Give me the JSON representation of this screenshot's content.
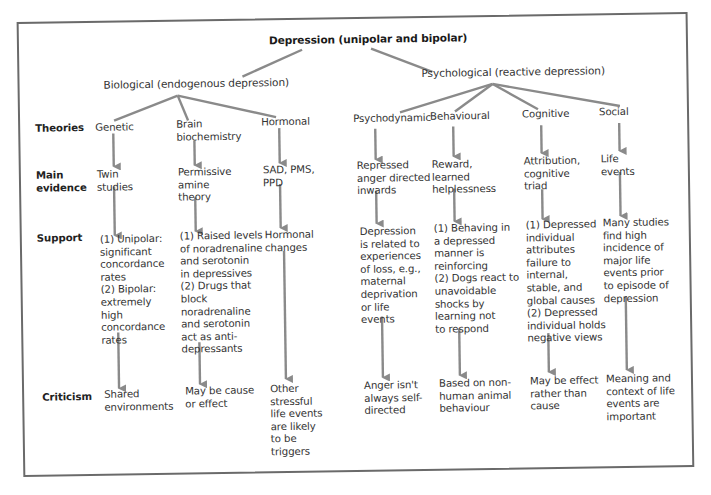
{
  "diagram": {
    "title": "Depression (unipolar and bipolar)",
    "branches": [
      {
        "label": "Biological (endogenous depression)"
      },
      {
        "label": "Psychological (reactive depression)"
      }
    ],
    "row_labels": {
      "theories": "Theories",
      "main_evidence": "Main\nevidence",
      "support": "Support",
      "criticism": "Criticism"
    },
    "columns": [
      {
        "branch": "Biological",
        "theory": "Genetic",
        "evidence": "Twin\nstudies",
        "support": "(1) Unipolar:\nsignificant\nconcordance\nrates\n(2) Bipolar:\nextremely\nhigh\nconcordance\nrates",
        "criticism": "Shared\nenvironments"
      },
      {
        "branch": "Biological",
        "theory": "Brain\nbiochemistry",
        "evidence": "Permissive\namine\ntheory",
        "support": "(1) Raised levels\nof noradrenaline\nand serotonin\nin depressives\n(2) Drugs that\nblock\nnoradrenaline\nand serotonin\nact as anti-\ndepressants",
        "criticism": "May be cause\nor effect"
      },
      {
        "branch": "Biological",
        "theory": "Hormonal",
        "evidence": "SAD, PMS,\nPPD",
        "support": "Hormonal\nchanges",
        "criticism": "Other\nstressful\nlife events\nare likely\nto be\ntriggers"
      },
      {
        "branch": "Psychological",
        "theory": "Psychodynamic",
        "evidence": "Repressed\nanger directed\ninwards",
        "support": "Depression\nis related to\nexperiences\nof loss, e.g.,\nmaternal\ndeprivation\nor life\nevents",
        "criticism": "Anger isn't\nalways self-\ndirected"
      },
      {
        "branch": "Psychological",
        "theory": "Behavioural",
        "evidence": "Reward,\nlearned\nhelplessness",
        "support": "(1) Behaving in\na depressed\nmanner is\nreinforcing\n(2) Dogs react to\nunavoidable\nshocks by\nlearning not\nto respond",
        "criticism": "Based on non-\nhuman animal\nbehaviour"
      },
      {
        "branch": "Psychological",
        "theory": "Cognitive",
        "evidence": "Attribution,\ncognitive\ntriad",
        "support": "(1) Depressed\nindividual\nattributes\nfailure to\ninternal,\nstable, and\nglobal causes\n(2) Depressed\nindividual holds\nnegative views",
        "criticism": "May be effect\nrather than\ncause"
      },
      {
        "branch": "Psychological",
        "theory": "Social",
        "evidence": "Life\nevents",
        "support": "Many studies\nfind high\nincidence of\nmajor life\nevents prior\nto episode of\ndepression",
        "criticism": "Meaning and\ncontext of life\nevents are\nimportant"
      }
    ],
    "colors": {
      "lines": "#8a8a8a",
      "frame": "#6a6a6a",
      "text": "#333333"
    }
  }
}
